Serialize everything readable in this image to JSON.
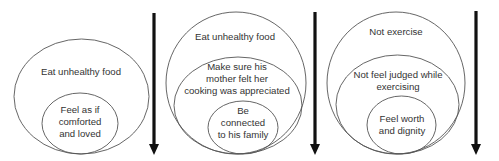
{
  "diagrams": [
    {
      "levels": [
        {
          "label": "Eat unhealthy food"
        },
        {
          "label_lines": [
            "Feel as if",
            "comforted",
            "and loved"
          ]
        }
      ]
    },
    {
      "levels": [
        {
          "label": "Eat unhealthy food"
        },
        {
          "label_lines": [
            "Make sure his",
            "mother felt her",
            "cooking was appreciated"
          ]
        },
        {
          "label_lines": [
            "Be",
            "connected",
            "to his family"
          ]
        }
      ]
    },
    {
      "levels": [
        {
          "label": "Not exercise"
        },
        {
          "label_lines": [
            "Not feel judged while",
            "exercising"
          ]
        },
        {
          "label_lines": [
            "Feel worth",
            "and dignity"
          ]
        }
      ]
    }
  ],
  "arrows": [
    {
      "direction": "down",
      "icon": "down-arrow-icon"
    },
    {
      "direction": "down",
      "icon": "down-arrow-icon"
    },
    {
      "direction": "down",
      "icon": "down-arrow-icon"
    }
  ],
  "colors": {
    "stroke": "#555555",
    "arrow": "#111111",
    "text": "#333333",
    "background": "#ffffff"
  }
}
